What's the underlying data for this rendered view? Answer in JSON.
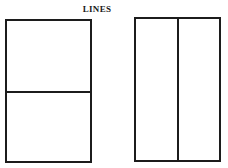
{
  "title": "LINES",
  "diagram": {
    "figures": [
      {
        "name": "rectangle-horizontal-line",
        "shape": "rectangle",
        "divider": "horizontal",
        "divider_position": "middle"
      },
      {
        "name": "rectangle-vertical-line",
        "shape": "rectangle",
        "divider": "vertical",
        "divider_position": "middle"
      }
    ],
    "line_color": "#1c1c1c",
    "background_color": "#ffffff"
  }
}
